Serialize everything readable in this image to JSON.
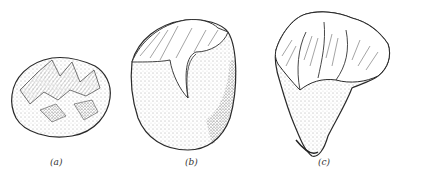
{
  "figure": {
    "items": [
      {
        "id": "a",
        "label": "(a)",
        "description": "rounded pebble core with flaked facets"
      },
      {
        "id": "b",
        "label": "(b)",
        "description": "pebble tool with flaked upper edge and cortex base"
      },
      {
        "id": "c",
        "label": "(c)",
        "description": "triangular chopper with large flake scars above"
      }
    ],
    "colors": {
      "ink": "#2a2a2a",
      "background": "#ffffff",
      "stipple": "#555555"
    }
  }
}
